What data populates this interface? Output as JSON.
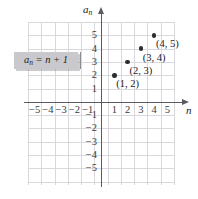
{
  "figure": {
    "kind": "coordinate-plane-scatter",
    "background_color": "#ffffff",
    "grid_color": "#d9d9dd",
    "axis_color": "#5a5a62",
    "point_color": "#2b2b31",
    "callout_bg_color": "#c9c9cd"
  },
  "axes": {
    "x_name": "n",
    "y_name_base": "a",
    "y_name_sub": "n",
    "x_ticks_negative": [
      "−5",
      "−4",
      "−3",
      "−2",
      "−1"
    ],
    "x_ticks_positive": [
      "1",
      "2",
      "3",
      "4",
      "5"
    ],
    "y_ticks_positive": [
      "5",
      "4",
      "3",
      "2",
      "1"
    ],
    "y_ticks_negative": [
      "−1",
      "−2",
      "−3",
      "−4",
      "−5"
    ],
    "xlim": [
      -5.5,
      5.5
    ],
    "ylim": [
      -6,
      6
    ]
  },
  "callout": {
    "formula_base": "a",
    "formula_sub": "n",
    "formula_rest": " = n + 1"
  },
  "chart_data": {
    "type": "scatter",
    "title": "",
    "xlabel": "n",
    "ylabel": "a_n",
    "grid": true,
    "legend": false,
    "xlim": [
      -5.5,
      5.5
    ],
    "ylim": [
      -6,
      6
    ],
    "annotation": "a_n = n + 1",
    "series": [
      {
        "name": "a_n = n + 1",
        "x": [
          1,
          2,
          3,
          4
        ],
        "y": [
          2,
          3,
          4,
          5
        ],
        "point_labels": [
          "(1, 2)",
          "(2, 3)",
          "(3, 4)",
          "(4, 5)"
        ]
      }
    ]
  }
}
